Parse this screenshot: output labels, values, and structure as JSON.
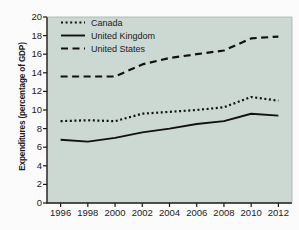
{
  "chart_data": {
    "type": "line",
    "title": "",
    "subtitle": "",
    "xlabel": "",
    "ylabel": "Expenditures (percentage of GDP)",
    "x": [
      1996,
      1998,
      2000,
      2002,
      2004,
      2006,
      2008,
      2010,
      2012
    ],
    "xtick_labels": [
      "1996",
      "1998",
      "2000",
      "2002",
      "2004",
      "2006",
      "2008",
      "2010",
      "2012"
    ],
    "ytick_labels": [
      "0",
      "2",
      "4",
      "6",
      "8",
      "10",
      "12",
      "14",
      "16",
      "18",
      "20"
    ],
    "yticks": [
      0,
      2,
      4,
      6,
      8,
      10,
      12,
      14,
      16,
      18,
      20
    ],
    "xlim": [
      1995,
      2013
    ],
    "ylim": [
      0,
      20
    ],
    "grid": false,
    "legend_position": "upper-left-inside",
    "plot_background": "#ccd9d2",
    "line_color": "#111111",
    "series": [
      {
        "name": "Canada",
        "style": "dotted",
        "values": [
          8.8,
          8.9,
          8.8,
          9.6,
          9.8,
          10.0,
          10.3,
          11.4,
          11.0
        ]
      },
      {
        "name": "United Kingdom",
        "style": "solid",
        "values": [
          6.8,
          6.6,
          7.0,
          7.6,
          8.0,
          8.5,
          8.8,
          9.6,
          9.4
        ]
      },
      {
        "name": "United States",
        "style": "dashed",
        "values": [
          13.6,
          13.6,
          13.6,
          14.9,
          15.6,
          16.0,
          16.4,
          17.7,
          17.9
        ]
      }
    ]
  }
}
